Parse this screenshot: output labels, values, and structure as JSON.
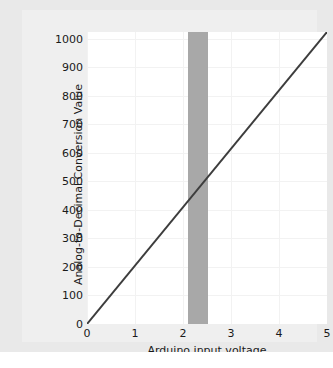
{
  "chart_data": {
    "type": "line",
    "title": "",
    "subtitle": "",
    "xlabel": "Arduino input voltage",
    "ylabel": "Analog-to-Decimal Conversion Value",
    "xlim": [
      0,
      5
    ],
    "ylim": [
      0,
      1023
    ],
    "xticks": [
      0,
      1,
      2,
      3,
      4,
      5
    ],
    "xtick_labels": [
      "0",
      "1",
      "2",
      "3",
      "4",
      "5"
    ],
    "yticks": [
      0,
      100,
      200,
      300,
      400,
      500,
      600,
      700,
      800,
      900,
      1000
    ],
    "ytick_labels": [
      "0",
      "100",
      "200",
      "300",
      "400",
      "500",
      "600",
      "700",
      "800",
      "900",
      "1000"
    ],
    "grid": true,
    "legend": false,
    "legend_position": "none",
    "series": [
      {
        "name": "ADC conversion",
        "type": "line",
        "color": "#3d3d3d",
        "x": [
          0,
          5
        ],
        "values": [
          0,
          1023
        ]
      }
    ],
    "annotations": [
      {
        "name": "highlight-band",
        "type": "vertical-band",
        "x_start": 2.1,
        "x_end": 2.52,
        "y_start": 0,
        "y_end": 1023,
        "color": "#a8a8a8",
        "label": ""
      }
    ],
    "colors": {
      "line": "#3d3d3d",
      "band": "#a8a8a8",
      "grid": "#f2f2f2",
      "plot_background": "#ffffff",
      "figure_background": "#e9e9e9",
      "canvas_background": "#efefef",
      "tick_text": "#1a1a1a"
    }
  }
}
